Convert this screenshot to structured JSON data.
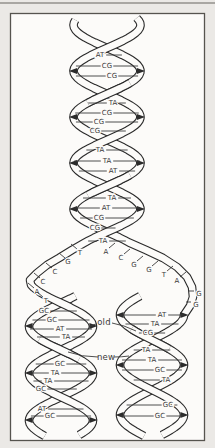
{
  "figure": {
    "colors": {
      "page_background": "#ebe9e6",
      "box_fill": "#fcfbf9",
      "box_border": "#56544f",
      "strand_line": "#2b2b2b",
      "label_text": "#3a3a3a",
      "top_rule": "#a9a7a3"
    },
    "top_helix_pairs": [
      {
        "label": "AT",
        "x": 100,
        "y": 55
      },
      {
        "label": "CG",
        "x": 107,
        "y": 66
      },
      {
        "label": "CG",
        "x": 112,
        "y": 76
      },
      {
        "label": "TA",
        "x": 113,
        "y": 103
      },
      {
        "label": "CG",
        "x": 107,
        "y": 113
      },
      {
        "label": "CG",
        "x": 99,
        "y": 122
      },
      {
        "label": "CG",
        "x": 95,
        "y": 131
      },
      {
        "label": "TA",
        "x": 100,
        "y": 150
      },
      {
        "label": "TA",
        "x": 107,
        "y": 161
      },
      {
        "label": "AT",
        "x": 113,
        "y": 171
      },
      {
        "label": "TA",
        "x": 112,
        "y": 198
      },
      {
        "label": "AT",
        "x": 106,
        "y": 208
      },
      {
        "label": "CG",
        "x": 99,
        "y": 218
      },
      {
        "label": "CG",
        "x": 95,
        "y": 228
      },
      {
        "label": "TA",
        "x": 103,
        "y": 241
      }
    ],
    "fork_left_bases": [
      {
        "label": "T",
        "x": 80,
        "y": 253,
        "dir": "ul"
      },
      {
        "label": "G",
        "x": 68,
        "y": 262,
        "dir": "ul"
      },
      {
        "label": "C",
        "x": 55,
        "y": 272,
        "dir": "ul"
      },
      {
        "label": "C",
        "x": 43,
        "y": 282,
        "dir": "ul"
      },
      {
        "label": "A",
        "x": 37,
        "y": 292,
        "dir": "ul"
      },
      {
        "label": "T",
        "x": 46,
        "y": 301,
        "dir": "ul"
      }
    ],
    "fork_right_bases": [
      {
        "label": "A",
        "x": 106,
        "y": 252,
        "dir": "ur"
      },
      {
        "label": "C",
        "x": 121,
        "y": 258,
        "dir": "ur"
      },
      {
        "label": "G",
        "x": 134,
        "y": 265,
        "dir": "ur"
      },
      {
        "label": "G",
        "x": 149,
        "y": 270,
        "dir": "ur"
      },
      {
        "label": "T",
        "x": 164,
        "y": 275,
        "dir": "ur"
      },
      {
        "label": "A",
        "x": 177,
        "y": 281,
        "dir": "ur"
      },
      {
        "label": "G",
        "x": 199,
        "y": 294,
        "dir": "l"
      },
      {
        "label": "G",
        "x": 196,
        "y": 305,
        "dir": "l"
      }
    ],
    "left_helix_pairs": [
      {
        "label": "GC",
        "x": 44,
        "y": 311
      },
      {
        "label": "GC",
        "x": 52,
        "y": 320
      },
      {
        "label": "AT",
        "x": 60,
        "y": 329
      },
      {
        "label": "TA",
        "x": 66,
        "y": 337
      },
      {
        "label": "GC",
        "x": 60,
        "y": 364
      },
      {
        "label": "TA",
        "x": 55,
        "y": 373
      },
      {
        "label": "TA",
        "x": 48,
        "y": 381
      },
      {
        "label": "GC",
        "x": 41,
        "y": 389
      },
      {
        "label": "AT",
        "x": 42,
        "y": 409
      },
      {
        "label": "GC",
        "x": 50,
        "y": 416
      }
    ],
    "right_helix_pairs": [
      {
        "label": "AT",
        "x": 162,
        "y": 315
      },
      {
        "label": "TA",
        "x": 155,
        "y": 324
      },
      {
        "label": "CG",
        "x": 148,
        "y": 333
      },
      {
        "label": "TA",
        "x": 146,
        "y": 350
      },
      {
        "label": "TA",
        "x": 152,
        "y": 360
      },
      {
        "label": "GC",
        "x": 160,
        "y": 370
      },
      {
        "label": "TA",
        "x": 166,
        "y": 380
      },
      {
        "label": "GC",
        "x": 168,
        "y": 405
      },
      {
        "label": "GC",
        "x": 160,
        "y": 416
      }
    ],
    "annotations": {
      "old": {
        "label": "old",
        "x": 104,
        "y": 322
      },
      "new": {
        "label": "new",
        "x": 106,
        "y": 357
      }
    }
  }
}
